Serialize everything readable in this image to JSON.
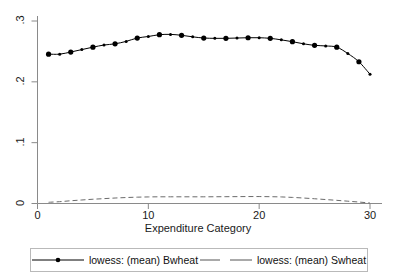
{
  "chart_data": {
    "type": "line",
    "title": "",
    "subtitle": "",
    "xlabel": "Expenditure Category",
    "ylabel": "",
    "xlim": [
      0,
      31
    ],
    "ylim": [
      0,
      0.31
    ],
    "grid": false,
    "legend_position": "bottom",
    "xticks": [
      0,
      10,
      20,
      30
    ],
    "xticklabels": [
      "0",
      "10",
      "20",
      "30"
    ],
    "yticks": [
      0,
      0.1,
      0.2,
      0.3
    ],
    "yticklabels": [
      "0",
      ".1",
      ".2",
      ".3"
    ],
    "x": [
      1,
      2,
      3,
      4,
      5,
      6,
      7,
      8,
      9,
      10,
      11,
      12,
      13,
      14,
      15,
      16,
      17,
      18,
      19,
      20,
      21,
      22,
      23,
      24,
      25,
      26,
      27,
      28,
      29,
      30
    ],
    "series": [
      {
        "name": "lowess: (mean) Bwheat",
        "style": "solid",
        "marker": "circle",
        "color": "#000000",
        "values": [
          0.2455,
          0.2455,
          0.249,
          0.253,
          0.257,
          0.2605,
          0.2625,
          0.2665,
          0.272,
          0.2745,
          0.2775,
          0.278,
          0.2765,
          0.274,
          0.272,
          0.2715,
          0.2715,
          0.272,
          0.2725,
          0.2725,
          0.2715,
          0.269,
          0.266,
          0.2625,
          0.26,
          0.259,
          0.257,
          0.2465,
          0.233,
          0.2125
        ]
      },
      {
        "name": "lowess: (mean) Swheat",
        "style": "dashed",
        "marker": "none",
        "color": "#6b6b6b",
        "values": [
          0.002,
          0.003,
          0.0045,
          0.0058,
          0.007,
          0.008,
          0.009,
          0.0098,
          0.0104,
          0.0108,
          0.011,
          0.011,
          0.011,
          0.011,
          0.011,
          0.0111,
          0.0112,
          0.0113,
          0.0114,
          0.0114,
          0.0112,
          0.0108,
          0.01,
          0.009,
          0.0078,
          0.0065,
          0.0052,
          0.0038,
          0.0024,
          0.0008
        ]
      }
    ]
  },
  "legend": {
    "entries": [
      {
        "label": "lowess: (mean) Bwheat"
      },
      {
        "label": "lowess: (mean) Swheat"
      }
    ]
  },
  "axes": {
    "x_title": "Expenditure Category"
  }
}
